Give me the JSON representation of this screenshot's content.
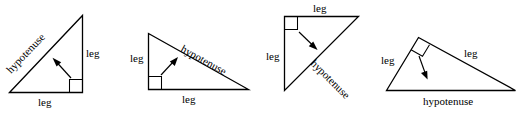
{
  "figure": {
    "background_color": "#ffffff",
    "line_color": "#000000",
    "text_color": "#000000",
    "label_terms": {
      "leg": "leg",
      "hypotenuse": "hypotenuse"
    }
  },
  "triangles": [
    {
      "id": "triangle-1",
      "orientation": "right angle at bottom-right",
      "labels": {
        "hypotenuse": "hypotenuse",
        "leg_vertical": "leg",
        "leg_horizontal": "leg"
      }
    },
    {
      "id": "triangle-2",
      "orientation": "right angle at bottom-left",
      "labels": {
        "hypotenuse": "hypotenuse",
        "leg_vertical": "leg",
        "leg_horizontal": "leg"
      }
    },
    {
      "id": "triangle-3",
      "orientation": "right angle at top-left",
      "labels": {
        "hypotenuse": "hypotenuse",
        "leg_vertical": "leg",
        "leg_horizontal": "leg"
      }
    },
    {
      "id": "triangle-4",
      "orientation": "right angle at apex, hypotenuse on bottom",
      "labels": {
        "hypotenuse": "hypotenuse",
        "leg_left": "leg",
        "leg_right": "leg"
      }
    }
  ]
}
